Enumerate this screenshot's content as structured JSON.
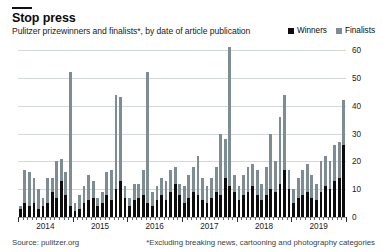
{
  "header": {
    "title": "Stop press",
    "subtitle": "Pulitzer prizewinners and finalists*, by date of article publication"
  },
  "legend": {
    "position": "top-right",
    "items": [
      {
        "label": "Winners",
        "color": "#0d0d0d"
      },
      {
        "label": "Finalists",
        "color": "#7e8c93"
      }
    ]
  },
  "footer": {
    "source": "Source: pulitzer.org",
    "footnote": "*Excluding breaking news, cartooning and photography categories"
  },
  "chart_data": {
    "type": "bar",
    "stacked": true,
    "title": "Stop press",
    "subtitle": "Pulitzer prizewinners and finalists*, by date of article publication",
    "xlabel": "",
    "ylabel": "",
    "ylim": [
      0,
      60
    ],
    "yticks": [
      0,
      10,
      20,
      30,
      40,
      50,
      60
    ],
    "grid": true,
    "legend_position": "top-right",
    "x_tick_labels": [
      "2014",
      "2015",
      "2016",
      "2017",
      "2018",
      "2019"
    ],
    "x_axis_note": "monthly bars, Jan 2014 - Dec 2019",
    "categories": [
      "2014-01",
      "2014-02",
      "2014-03",
      "2014-04",
      "2014-05",
      "2014-06",
      "2014-07",
      "2014-08",
      "2014-09",
      "2014-10",
      "2014-11",
      "2014-12",
      "2015-01",
      "2015-02",
      "2015-03",
      "2015-04",
      "2015-05",
      "2015-06",
      "2015-07",
      "2015-08",
      "2015-09",
      "2015-10",
      "2015-11",
      "2015-12",
      "2016-01",
      "2016-02",
      "2016-03",
      "2016-04",
      "2016-05",
      "2016-06",
      "2016-07",
      "2016-08",
      "2016-09",
      "2016-10",
      "2016-11",
      "2016-12",
      "2017-01",
      "2017-02",
      "2017-03",
      "2017-04",
      "2017-05",
      "2017-06",
      "2017-07",
      "2017-08",
      "2017-09",
      "2017-10",
      "2017-11",
      "2017-12",
      "2018-01",
      "2018-02",
      "2018-03",
      "2018-04",
      "2018-05",
      "2018-06",
      "2018-07",
      "2018-08",
      "2018-09",
      "2018-10",
      "2018-11",
      "2018-12",
      "2019-01",
      "2019-02",
      "2019-03",
      "2019-04",
      "2019-05",
      "2019-06",
      "2019-07",
      "2019-08",
      "2019-09",
      "2019-10",
      "2019-11",
      "2019-12"
    ],
    "series": [
      {
        "name": "Winners",
        "color": "#0d0d0d",
        "values": [
          3,
          5,
          4,
          5,
          3,
          4,
          5,
          9,
          7,
          13,
          8,
          4,
          2,
          3,
          5,
          6,
          7,
          4,
          5,
          8,
          6,
          10,
          13,
          7,
          4,
          6,
          7,
          8,
          5,
          4,
          6,
          8,
          6,
          9,
          12,
          8,
          5,
          7,
          9,
          8,
          6,
          5,
          7,
          9,
          8,
          14,
          11,
          9,
          6,
          8,
          9,
          11,
          8,
          6,
          8,
          10,
          9,
          12,
          17,
          10,
          5,
          7,
          8,
          9,
          7,
          6,
          9,
          11,
          10,
          13,
          14,
          26
        ]
      },
      {
        "name": "Finalists",
        "color": "#7e8c93",
        "values": [
          1,
          12,
          12,
          9,
          7,
          3,
          9,
          5,
          13,
          8,
          8,
          48,
          3,
          5,
          6,
          9,
          6,
          3,
          4,
          8,
          11,
          34,
          30,
          4,
          3,
          6,
          5,
          9,
          47,
          5,
          5,
          6,
          7,
          8,
          6,
          4,
          6,
          8,
          9,
          14,
          8,
          6,
          7,
          9,
          22,
          14,
          50,
          6,
          5,
          7,
          9,
          8,
          9,
          6,
          10,
          20,
          11,
          24,
          27,
          7,
          5,
          7,
          9,
          10,
          8,
          6,
          11,
          11,
          10,
          13,
          13,
          16
        ]
      }
    ]
  }
}
